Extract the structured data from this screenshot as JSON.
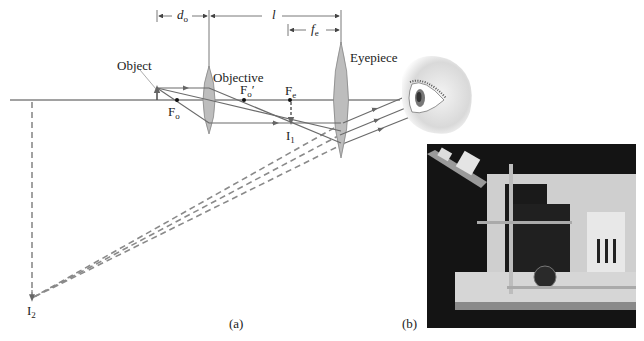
{
  "figure": {
    "panel_a": {
      "caption": "(a)",
      "labels": {
        "object": "Object",
        "objective": "Objective",
        "eyepiece": "Eyepiece",
        "fo": {
          "main": "F",
          "sub": "o"
        },
        "fo_prime": {
          "main": "F",
          "sub": "o",
          "prime": "′"
        },
        "fe": {
          "main": "F",
          "sub": "e"
        },
        "i1": {
          "main": "I",
          "sub": "1"
        },
        "i2": {
          "main": "I",
          "sub": "2"
        }
      },
      "dimensions": {
        "do": {
          "main": "d",
          "sub": "o"
        },
        "l": {
          "main": "l"
        },
        "fe": {
          "main": "f",
          "sub": "e"
        }
      }
    },
    "panel_b": {
      "caption": "(b)",
      "description": "photograph of compound microscope"
    }
  },
  "colors": {
    "ray": "#6b6b6b",
    "axis": "#444444",
    "lens_fill": "#b9b9b9",
    "dashed": "#8a8a8a"
  }
}
